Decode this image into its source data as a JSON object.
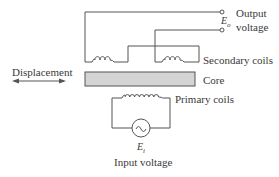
{
  "labels": {
    "displacement": "Displacement",
    "output_line1": "Output",
    "output_line2": "voltage",
    "output_symbol": "E",
    "output_subscript": "o",
    "secondary_coils": "Secondary coils",
    "core": "Core",
    "primary_coils": "Primary coils",
    "input_symbol": "E",
    "input_subscript": "i",
    "input_voltage": "Input voltage"
  },
  "colors": {
    "line": "#555555",
    "core_fill": "#d4d4d4",
    "text": "#3a3a3a"
  }
}
